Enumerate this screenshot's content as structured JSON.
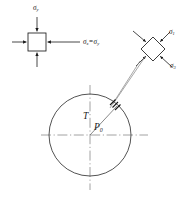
{
  "figure": {
    "type": "engineering-stress-diagram",
    "width": 188,
    "height": 197,
    "background_color": "#ffffff",
    "line_color": "#1a1a1a",
    "centerline_color": "#8c8c8c",
    "leader_color": "#7a7a7a"
  },
  "labels": {
    "sigma_y": {
      "symbol": "σ",
      "subscript": "y"
    },
    "sigma_x_eq_sigma_y": {
      "symbol": "σ",
      "subscript": "x",
      "equals": "=",
      "symbol2": "σ",
      "subscript2": "y"
    },
    "sigma_1": {
      "symbol": "σ",
      "subscript": "1"
    },
    "sigma_3": {
      "symbol": "σ",
      "subscript": "3"
    },
    "radius_T": {
      "symbol": "T"
    },
    "point_P0": {
      "symbol": "P",
      "subscript": "0"
    }
  },
  "elements": {
    "far_field_element": {
      "name": "square-stress-element",
      "center_x": 37,
      "center_y": 42,
      "half_size": 9,
      "arrow_direction": "inward",
      "arrow_count": 4
    },
    "rotated_element": {
      "name": "diamond-stress-element",
      "center_x": 153,
      "center_y": 49,
      "half_diagonal": 12,
      "rotation_deg": 45,
      "arrow_direction": "inward",
      "arrow_count": 4
    },
    "tunnel": {
      "name": "circular-opening",
      "center_x": 90,
      "center_y": 135,
      "radius": 41
    },
    "boundary_point": {
      "x": 118,
      "y": 105
    }
  }
}
